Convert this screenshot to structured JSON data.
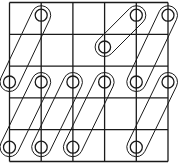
{
  "diagram": {
    "type": "grid-with-linked-rings",
    "grid": {
      "columns": 5,
      "rows": 5
    },
    "line_color": "#1a1a1a",
    "background": "#ffffff",
    "rings": [
      {
        "id": "r1",
        "col": 1,
        "row": 0.4
      },
      {
        "id": "r2",
        "col": 4,
        "row": 0.4
      },
      {
        "id": "r3",
        "col": 5,
        "row": 0.4
      },
      {
        "id": "r4",
        "col": 3,
        "row": 1.4
      },
      {
        "id": "r5",
        "col": 0,
        "row": 2.5
      },
      {
        "id": "r6",
        "col": 1,
        "row": 2.5
      },
      {
        "id": "r7",
        "col": 2,
        "row": 2.5
      },
      {
        "id": "r8",
        "col": 3,
        "row": 2.5
      },
      {
        "id": "r9",
        "col": 4,
        "row": 2.5
      },
      {
        "id": "r10",
        "col": 5,
        "row": 2.5
      },
      {
        "id": "r11",
        "col": 0,
        "row": 4.55
      },
      {
        "id": "r12",
        "col": 1,
        "row": 4.55
      },
      {
        "id": "r13",
        "col": 2,
        "row": 4.55
      },
      {
        "id": "r14",
        "col": 4,
        "row": 4.55
      }
    ],
    "links": [
      {
        "from": "r1",
        "to": "r5"
      },
      {
        "from": "r2",
        "to": "r4"
      },
      {
        "from": "r3",
        "to": "r9"
      },
      {
        "from": "r6",
        "to": "r11"
      },
      {
        "from": "r7",
        "to": "r12"
      },
      {
        "from": "r8",
        "to": "r13"
      },
      {
        "from": "r10",
        "to": "r14"
      }
    ]
  }
}
